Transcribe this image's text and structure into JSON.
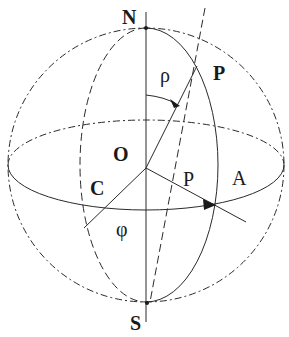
{
  "diagram": {
    "labels": {
      "north": "N",
      "south": "S",
      "center": "O",
      "pole": "P",
      "rho": "ρ",
      "p_vector": "P",
      "a_point": "A",
      "c_point": "C",
      "phi": "φ"
    },
    "colors": {
      "line": "#2a2a2a",
      "text": "#1a1a1a",
      "background": "#ffffff"
    }
  }
}
